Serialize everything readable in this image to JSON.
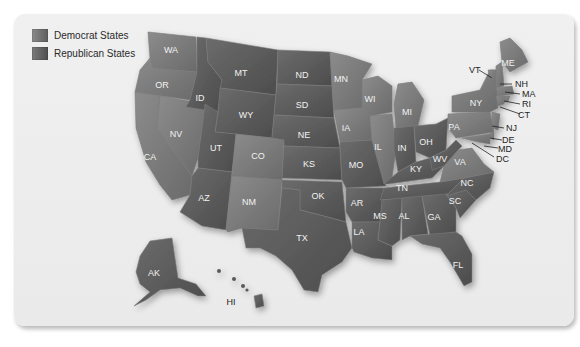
{
  "legend": {
    "items": [
      {
        "label": "Democrat States",
        "color": "#6f6f6f"
      },
      {
        "label": "Republican States",
        "color": "#5c5c5c"
      }
    ]
  },
  "colors": {
    "democrat": "#7d7d7d",
    "republican": "#5a5a5a",
    "card_background": "#ececec",
    "label_text": "#f2f2f2",
    "callout_text": "#1e1e1e"
  },
  "states": {
    "WA": "WA",
    "OR": "OR",
    "CA": "CA",
    "NV": "NV",
    "ID": "ID",
    "MT": "MT",
    "WY": "WY",
    "UT": "UT",
    "AZ": "AZ",
    "CO": "CO",
    "NM": "NM",
    "ND": "ND",
    "SD": "SD",
    "NE": "NE",
    "KS": "KS",
    "OK": "OK",
    "TX": "TX",
    "MN": "MN",
    "IA": "IA",
    "MO": "MO",
    "AR": "AR",
    "LA": "LA",
    "WI": "WI",
    "IL": "IL",
    "MI": "MI",
    "IN": "IN",
    "OH": "OH",
    "KY": "KY",
    "TN": "TN",
    "MS": "MS",
    "AL": "AL",
    "GA": "GA",
    "FL": "FL",
    "SC": "SC",
    "NC": "NC",
    "VA": "VA",
    "WV": "WV",
    "PA": "PA",
    "NY": "NY",
    "ME": "ME",
    "AK": "AK",
    "HI": "HI"
  },
  "callouts": {
    "VT": "VT",
    "NH": "NH",
    "MA": "MA",
    "RI": "RI",
    "CT": "CT",
    "NJ": "NJ",
    "DE": "DE",
    "MD": "MD",
    "DC": "DC"
  }
}
